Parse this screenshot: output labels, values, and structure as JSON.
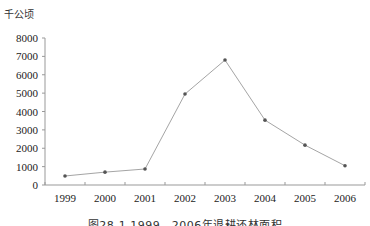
{
  "chart_data": {
    "type": "line",
    "title": "",
    "unit_label": "千公顷",
    "caption": "图28-1 1999—2006年退耕还林面积",
    "xlabel": "",
    "ylabel": "千公顷",
    "categories": [
      "1999",
      "2000",
      "2001",
      "2002",
      "2003",
      "2004",
      "2005",
      "2006"
    ],
    "series": [
      {
        "name": "退耕还林面积",
        "values": [
          490,
          700,
          870,
          4950,
          6800,
          3530,
          2170,
          1050
        ]
      }
    ],
    "ylim": [
      0,
      8000
    ],
    "yticks": [
      0,
      1000,
      2000,
      3000,
      4000,
      5000,
      6000,
      7000,
      8000
    ],
    "grid": false,
    "legend": "none",
    "line_color": "#9a9a9a",
    "marker_color": "#555555"
  }
}
